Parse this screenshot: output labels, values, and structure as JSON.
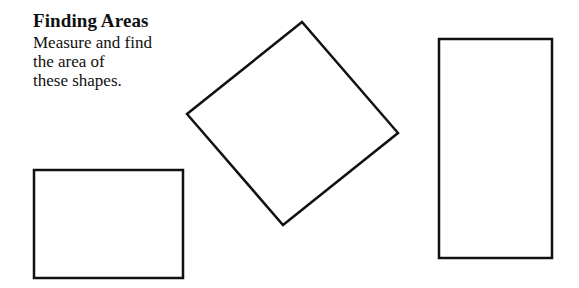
{
  "worksheet": {
    "title": "Finding Areas",
    "instructions": "Measure and find\nthe area of\nthese shapes."
  },
  "colors": {
    "background": "#ffffff",
    "ink": "#111111"
  },
  "shapes": [
    {
      "name": "rotated-square",
      "type": "polygon",
      "points": "302,22 187,114 283,225 398,133"
    },
    {
      "name": "tall-rectangle",
      "type": "rect",
      "x": 439,
      "y": 39,
      "width": 113,
      "height": 219
    },
    {
      "name": "wide-rectangle",
      "type": "rect",
      "x": 34,
      "y": 170,
      "width": 149,
      "height": 108
    }
  ]
}
